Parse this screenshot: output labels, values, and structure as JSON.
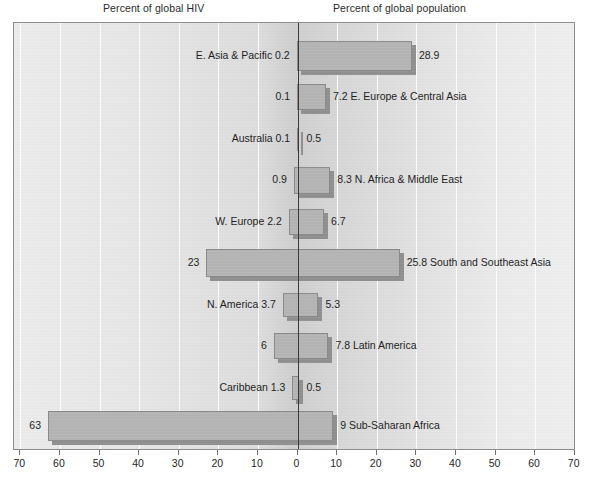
{
  "captions": {
    "left": "Percent of global HIV",
    "right": "Percent of global population"
  },
  "axis": {
    "tick_labels": [
      "70",
      "60",
      "50",
      "40",
      "30",
      "20",
      "10",
      "0",
      "10",
      "20",
      "30",
      "40",
      "50",
      "60",
      "70"
    ],
    "max": 70,
    "step": 10
  },
  "chart_data": {
    "type": "bar",
    "title": "",
    "subtitle": "",
    "orientation": "horizontal",
    "style": "bidirectional-tornado",
    "xlabel": "",
    "ylabel": "",
    "xlim": [
      -70,
      70
    ],
    "grid": true,
    "legend_position": "none",
    "left_axis_label": "Percent of global HIV",
    "right_axis_label": "Percent of global population",
    "categories": [
      "E. Asia & Pacific",
      "E. Europe & Central Asia",
      "Australia",
      "N. Africa & Middle East",
      "W. Europe",
      "South and Southeast Asia",
      "N. America",
      "Latin America",
      "Caribbean",
      "Sub-Saharan Africa"
    ],
    "series": [
      {
        "name": "Percent of global HIV",
        "side": "left",
        "values": [
          0.2,
          0.1,
          0.1,
          0.9,
          2.2,
          23,
          3.7,
          6,
          1.3,
          63
        ]
      },
      {
        "name": "Percent of global population",
        "side": "right",
        "values": [
          28.9,
          7.2,
          0.5,
          8.3,
          6.7,
          25.8,
          5.3,
          7.8,
          0.5,
          9
        ]
      }
    ]
  },
  "rows": [
    {
      "name": "E. Asia & Pacific",
      "hiv": "0.2",
      "hiv_value": 0.2,
      "pop": "28.9",
      "pop_value": 28.9,
      "label_side": "left",
      "y": 55,
      "h": 30
    },
    {
      "name": "E. Europe & Central Asia",
      "hiv": "0.1",
      "hiv_value": 0.1,
      "pop": "7.2",
      "pop_value": 7.2,
      "label_side": "right",
      "y": 96,
      "h": 26
    },
    {
      "name": "Australia",
      "hiv": "0.1",
      "hiv_value": 0.1,
      "pop": "0.5",
      "pop_value": 0.5,
      "label_side": "left",
      "y": 138,
      "h": 23
    },
    {
      "name": "N. Africa & Middle East",
      "hiv": "0.9",
      "hiv_value": 0.9,
      "pop": "8.3",
      "pop_value": 8.3,
      "label_side": "right",
      "y": 179,
      "h": 27
    },
    {
      "name": "W. Europe",
      "hiv": "2.2",
      "hiv_value": 2.2,
      "pop": "6.7",
      "pop_value": 6.7,
      "label_side": "left",
      "y": 221,
      "h": 26
    },
    {
      "name": "South and Southeast Asia",
      "hiv": "23",
      "hiv_value": 23,
      "pop": "25.8",
      "pop_value": 25.8,
      "label_side": "right",
      "y": 262,
      "h": 28
    },
    {
      "name": "N. America",
      "hiv": "3.7",
      "hiv_value": 3.7,
      "pop": "5.3",
      "pop_value": 5.3,
      "label_side": "left",
      "y": 304,
      "h": 24
    },
    {
      "name": "Latin America",
      "hiv": "6",
      "hiv_value": 6,
      "pop": "7.8",
      "pop_value": 7.8,
      "label_side": "right",
      "y": 345,
      "h": 26
    },
    {
      "name": "Caribbean",
      "hiv": "1.3",
      "hiv_value": 1.3,
      "pop": "0.5",
      "pop_value": 0.5,
      "label_side": "left",
      "y": 387,
      "h": 24
    },
    {
      "name": "Sub-Saharan Africa",
      "hiv": "63",
      "hiv_value": 63,
      "pop": "9",
      "pop_value": 9,
      "label_side": "right",
      "y": 425,
      "h": 30
    }
  ]
}
